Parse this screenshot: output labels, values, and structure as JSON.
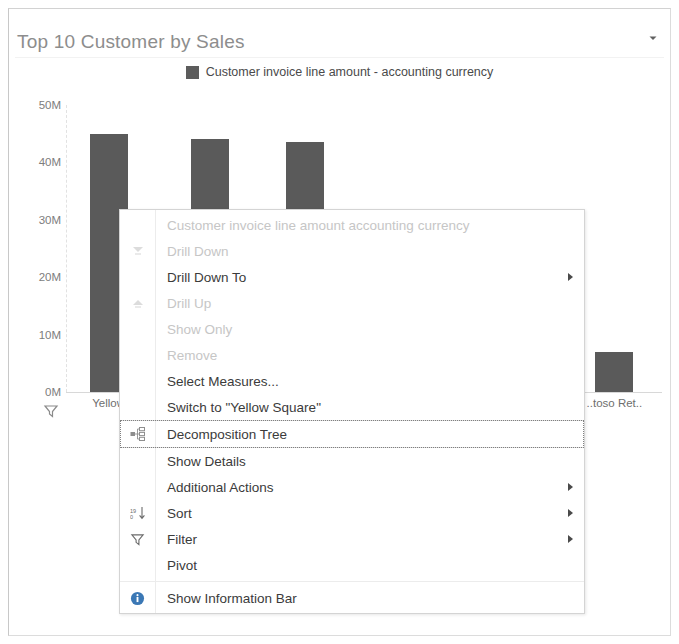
{
  "tile": {
    "title": "Top 10 Customer by Sales",
    "menu_caret_icon": "chevron-down-icon"
  },
  "legend": {
    "swatch_color": "#5c5c5c",
    "label": "Customer invoice line amount - accounting currency"
  },
  "chart_data": {
    "type": "bar",
    "title": "Top 10 Customer by Sales",
    "xlabel": "",
    "ylabel": "",
    "ylim": [
      0,
      50000000
    ],
    "ytick_labels": [
      "0M",
      "10M",
      "20M",
      "30M",
      "40M",
      "50M"
    ],
    "ytick_values": [
      0,
      10000000,
      20000000,
      30000000,
      40000000,
      50000000
    ],
    "grid": false,
    "legend_position": "top",
    "series": [
      {
        "name": "Customer invoice line amount - accounting currency",
        "color": "#5a5a5a",
        "values": [
          45000000,
          44000000,
          43500000,
          7000000
        ]
      }
    ],
    "categories": [
      "Yellow",
      "",
      "",
      "..toso Ret.."
    ],
    "category_positions_pct": [
      7,
      24,
      40,
      92
    ],
    "note": "middle category labels hidden behind context menu"
  },
  "chart_filter_icon": "filter-funnel-icon",
  "context_menu": {
    "items": [
      {
        "label": "Customer invoice line amount   accounting currency",
        "state": "header",
        "icon": "none",
        "submenu": false
      },
      {
        "label": "Drill Down",
        "state": "disabled",
        "icon": "drill-down-icon",
        "submenu": false
      },
      {
        "label": "Drill Down To",
        "state": "enabled",
        "icon": "none",
        "submenu": true
      },
      {
        "label": "Drill Up",
        "state": "disabled",
        "icon": "drill-up-icon",
        "submenu": false
      },
      {
        "label": "Show Only",
        "state": "disabled",
        "icon": "none",
        "submenu": false
      },
      {
        "label": "Remove",
        "state": "disabled",
        "icon": "none",
        "submenu": false
      },
      {
        "label": "Select Measures...",
        "state": "enabled",
        "icon": "none",
        "submenu": false
      },
      {
        "label": "Switch to \"Yellow Square\"",
        "state": "enabled",
        "icon": "none",
        "submenu": false
      },
      {
        "label": "Decomposition Tree",
        "state": "enabled",
        "icon": "decomposition-tree-icon",
        "submenu": false,
        "focused": true
      },
      {
        "label": "Show Details",
        "state": "enabled",
        "icon": "none",
        "submenu": false
      },
      {
        "label": "Additional Actions",
        "state": "enabled",
        "icon": "none",
        "submenu": true
      },
      {
        "label": "Sort",
        "state": "enabled",
        "icon": "sort-number-icon",
        "submenu": true
      },
      {
        "label": "Filter",
        "state": "enabled",
        "icon": "filter-funnel-icon",
        "submenu": true
      },
      {
        "label": "Pivot",
        "state": "enabled",
        "icon": "none",
        "submenu": false
      },
      {
        "label": "Show Information Bar",
        "state": "enabled",
        "icon": "info-circle-icon",
        "submenu": false,
        "separator_before": true
      }
    ]
  }
}
